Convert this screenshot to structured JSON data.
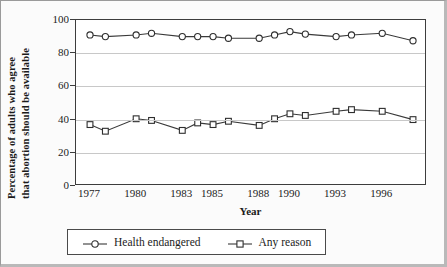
{
  "chart_data": {
    "type": "line",
    "title": "",
    "xlabel": "Year",
    "ylabel": "Percentage of adults who agree that abortion should be available",
    "ylabel_line1": "Percentage of adults who agree",
    "ylabel_line2": "that abortion should be available",
    "ylim": [
      0,
      100
    ],
    "ytick_values": [
      0,
      20,
      40,
      60,
      80,
      100
    ],
    "ytick_labels": [
      "0",
      "20",
      "40",
      "60",
      "80",
      "100"
    ],
    "xlim": [
      1977,
      1998
    ],
    "x": [
      1977,
      1978,
      1980,
      1981,
      1983,
      1984,
      1985,
      1986,
      1988,
      1989,
      1990,
      1991,
      1993,
      1994,
      1996,
      1998
    ],
    "xtick_values": [
      1977,
      1980,
      1983,
      1985,
      1988,
      1990,
      1993,
      1996
    ],
    "xtick_labels": [
      "1977",
      "1980",
      "1983",
      "1985",
      "1988",
      "1990",
      "1993",
      "1996"
    ],
    "grid": "horizontal",
    "legend_position": "below-axis",
    "series": [
      {
        "name": "Health endangered",
        "marker": "circle",
        "values": [
          91,
          90,
          91,
          92,
          90,
          90,
          90,
          89,
          89,
          91,
          93,
          91.5,
          90,
          91,
          92,
          87.5
        ]
      },
      {
        "name": "Any reason",
        "marker": "square",
        "values": [
          37,
          33,
          40.5,
          39.5,
          33.5,
          38,
          37,
          39,
          36.5,
          40.5,
          43.5,
          42.5,
          45,
          46,
          45,
          40
        ]
      }
    ],
    "colors": {
      "line": "#3a3a3a",
      "marker_fill": "#ffffff",
      "marker_stroke": "#2e2e2e",
      "grid": "#c8c8c8",
      "axis": "#3d3d3d",
      "frame": "#9a9a9a",
      "background": "#fbfbfb",
      "plot_background": "#ffffff"
    }
  },
  "legend": {
    "entries": [
      {
        "label": "Health endangered",
        "marker": "circle-marker-icon"
      },
      {
        "label": "Any reason",
        "marker": "square-marker-icon"
      }
    ]
  }
}
